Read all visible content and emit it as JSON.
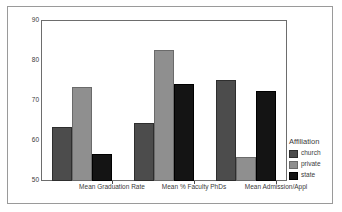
{
  "chart_data": {
    "type": "bar",
    "title": "",
    "subtitle": "",
    "xlabel": "",
    "ylabel": "",
    "categories": [
      "Mean Graduation Rate",
      "Mean % Faculty PhDs",
      "Mean Admission/Appl"
    ],
    "series": [
      {
        "name": "church",
        "color": "#4c4c4c",
        "values": [
          63.4,
          64.4,
          75.1
        ]
      },
      {
        "name": "private",
        "color": "#8f8f8f",
        "values": [
          73.4,
          82.6,
          56.0
        ]
      },
      {
        "name": "state",
        "color": "#141414",
        "values": [
          56.7,
          74.1,
          72.4
        ]
      }
    ],
    "ylim": [
      50,
      90
    ],
    "yticks": [
      50,
      60,
      70,
      80,
      90
    ],
    "ytick_labels": [
      "50",
      "60",
      "70",
      "80",
      "90"
    ],
    "grid": false,
    "legend_position": "right",
    "legend_title": "Affiliation",
    "legend_entries": [
      "church",
      "private",
      "state"
    ]
  },
  "legend": {
    "title": "Affiliation",
    "items": [
      {
        "label": "church"
      },
      {
        "label": "private"
      },
      {
        "label": "state"
      }
    ]
  },
  "axes": {
    "y_tick_labels": [
      "90",
      "80",
      "70",
      "60",
      "50"
    ],
    "x_tick_labels": [
      "Mean Graduation Rate",
      "Mean % Faculty PhDs",
      "Mean Admission/Appl"
    ]
  }
}
